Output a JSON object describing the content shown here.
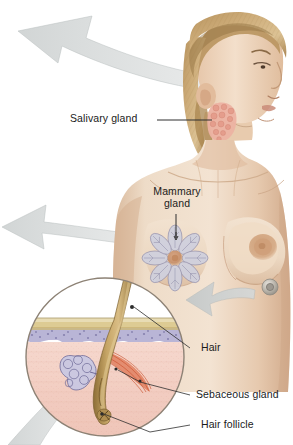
{
  "figure": {
    "background_color": "#ffffff"
  },
  "labels": {
    "salivary_gland": "Salivary gland",
    "mammary_gland_line1": "Mammary",
    "mammary_gland_line2": "gland",
    "hair": "Hair",
    "sebaceous_gland": "Sebaceous gland",
    "hair_follicle": "Hair follicle"
  },
  "colors": {
    "arrow_gray": "#c9cdcd",
    "arrow_gray_edge": "#b4baba",
    "skin_light": "#f0ddc9",
    "skin_mid": "#e3c7ad",
    "skin_shadow": "#cfae91",
    "hair_blonde": "#c8a373",
    "hair_blonde_dark": "#9a7647",
    "salivary_pink": "#e8a99a",
    "dermis_pink": "#f2cfc4",
    "epidermis_tan": "#e4d5a8",
    "basal_purple": "#a9a6cc",
    "follicle_brown": "#b59457",
    "muscle_red": "#d9613f",
    "leader_line": "#3a3a3a",
    "circle_border": "#8d8275",
    "text": "#1b1b1b"
  },
  "parts": {
    "head": "woman-head-profile",
    "torso": "woman-torso-front",
    "salivary_gland_cluster": "parotid-gland-lobules",
    "mammary_rosette": "mammary-gland-lobes",
    "skin_magnifier": "skin-cross-section-circle",
    "snap_fastener": "metal-stud"
  },
  "arrows": {
    "top_left": "arrow-from-head-upper-left",
    "middle_left": "arrow-from-chest-left",
    "lower_left": "arrow-from-skin-circle-lower-left",
    "right_inward": "arrow-into-torso-left"
  }
}
